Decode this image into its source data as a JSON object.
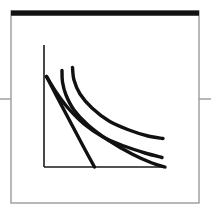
{
  "figure": {
    "title": "",
    "caption": "",
    "background_color": "#ffffff",
    "frame": {
      "name": "figure-border",
      "left": 11,
      "top": 11,
      "right": 199,
      "bottom": 203,
      "line_color": "#9a9a9a",
      "line_width": 1.4,
      "top_bar": {
        "name": "top-rule",
        "color": "#111111",
        "thickness": 5.2,
        "x1": 11,
        "x2": 199,
        "y": 13.2
      }
    },
    "edge_ticks": [
      {
        "name": "left-edge-tick",
        "x1": 0,
        "x2": 11,
        "y": 99,
        "color": "#9a9a9a",
        "line_width": 1.4
      },
      {
        "name": "right-edge-tick",
        "x1": 199,
        "x2": 211,
        "y": 99,
        "color": "#9a9a9a",
        "line_width": 1.4
      }
    ]
  },
  "chart_data": {
    "type": "line",
    "title": "",
    "subtitle": "",
    "xlabel": "",
    "ylabel": "",
    "xlim": [
      0,
      100
    ],
    "ylim": [
      0,
      100
    ],
    "grid": false,
    "legend": null,
    "legend_position": "none",
    "tick_labels": {
      "x": [],
      "y": []
    },
    "axis_style": {
      "color": "#1a1a1a",
      "line_width": 1.6,
      "origin_px": [
        44,
        167
      ],
      "y_axis_top_px": 45,
      "x_axis_right_px": 166,
      "spines": [
        "left",
        "bottom"
      ]
    },
    "series": [
      {
        "name": "curve-1-steep-linear",
        "color": "#111111",
        "line_width": 3.4,
        "note": "near-straight steep falling line from y-axis to x-axis",
        "points_px": [
          [
            46.5,
            76.5
          ],
          [
            55,
            93
          ],
          [
            64,
            110
          ],
          [
            73,
            127
          ],
          [
            82,
            144
          ],
          [
            89,
            157
          ],
          [
            94.5,
            167
          ]
        ],
        "values": [
          {
            "x": 1.6,
            "y": 74.2
          },
          {
            "x": 9.0,
            "y": 60.7
          },
          {
            "x": 16.4,
            "y": 46.7
          },
          {
            "x": 23.8,
            "y": 32.8
          },
          {
            "x": 31.1,
            "y": 18.9
          },
          {
            "x": 36.9,
            "y": 8.2
          },
          {
            "x": 41.4,
            "y": 0.0
          }
        ]
      },
      {
        "name": "curve-2-lower-convex",
        "color": "#111111",
        "line_width": 3.4,
        "note": "convex decreasing curve, flattens near right, ends high-left of axis end",
        "points_px": [
          [
            46.5,
            76.5
          ],
          [
            56,
            92
          ],
          [
            68,
            108
          ],
          [
            84,
            124
          ],
          [
            103,
            137
          ],
          [
            124,
            146
          ],
          [
            145,
            153
          ],
          [
            162,
            157.5
          ]
        ],
        "values": [
          {
            "x": 1.6,
            "y": 74.2
          },
          {
            "x": 9.8,
            "y": 61.5
          },
          {
            "x": 19.7,
            "y": 48.4
          },
          {
            "x": 32.8,
            "y": 35.2
          },
          {
            "x": 48.4,
            "y": 24.6
          },
          {
            "x": 65.6,
            "y": 17.2
          },
          {
            "x": 82.8,
            "y": 11.5
          },
          {
            "x": 96.7,
            "y": 7.8
          }
        ]
      },
      {
        "name": "curve-3-middle-convex",
        "color": "#111111",
        "line_width": 3.4,
        "note": "starts as a short vertical stub then bends right, crosses curve-2, ends at bottom right",
        "points_px": [
          [
            62,
            70.5
          ],
          [
            62.5,
            82
          ],
          [
            66,
            95
          ],
          [
            74,
            110
          ],
          [
            88,
            125
          ],
          [
            108,
            140
          ],
          [
            132,
            154
          ],
          [
            152,
            163
          ],
          [
            165,
            167
          ]
        ],
        "values": [
          {
            "x": 14.8,
            "y": 79.1
          },
          {
            "x": 15.2,
            "y": 69.7
          },
          {
            "x": 18.0,
            "y": 59.0
          },
          {
            "x": 24.6,
            "y": 46.7
          },
          {
            "x": 36.1,
            "y": 34.4
          },
          {
            "x": 52.5,
            "y": 22.1
          },
          {
            "x": 72.1,
            "y": 10.7
          },
          {
            "x": 88.5,
            "y": 3.3
          },
          {
            "x": 99.2,
            "y": 0.0
          }
        ]
      },
      {
        "name": "curve-4-upper-convex",
        "color": "#111111",
        "line_width": 3.4,
        "note": "highest starting curve, steep then flat, ends above the others on the right",
        "points_px": [
          [
            72.5,
            67.5
          ],
          [
            74,
            80
          ],
          [
            80,
            94
          ],
          [
            92,
            108
          ],
          [
            109,
            121
          ],
          [
            129,
            130
          ],
          [
            148,
            136
          ],
          [
            163,
            138.5
          ]
        ],
        "values": [
          {
            "x": 23.4,
            "y": 81.6
          },
          {
            "x": 24.6,
            "y": 71.3
          },
          {
            "x": 29.5,
            "y": 59.8
          },
          {
            "x": 39.3,
            "y": 48.4
          },
          {
            "x": 53.3,
            "y": 37.7
          },
          {
            "x": 69.7,
            "y": 30.3
          },
          {
            "x": 85.2,
            "y": 25.4
          },
          {
            "x": 97.5,
            "y": 23.4
          }
        ]
      }
    ]
  }
}
